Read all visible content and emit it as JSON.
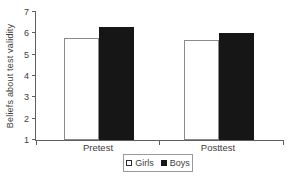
{
  "chart_data": {
    "type": "bar",
    "title": "",
    "xlabel": "",
    "ylabel": "Beliefs about test validity",
    "categories": [
      "Pretest",
      "Posttest"
    ],
    "series": [
      {
        "name": "Girls",
        "fill": "#ffffff",
        "border": "#8a8a8a",
        "values": [
          5.8,
          5.7
        ]
      },
      {
        "name": "Boys",
        "fill": "#161616",
        "border": "#161616",
        "values": [
          6.3,
          6.0
        ]
      }
    ],
    "ylim": [
      1,
      7
    ],
    "yticks": [
      1,
      2,
      3,
      4,
      5,
      6,
      7
    ],
    "grid": false,
    "legend_position": "bottom-center",
    "colors": {
      "axis": "#5f5f5f",
      "text": "#3d3d3d"
    }
  }
}
